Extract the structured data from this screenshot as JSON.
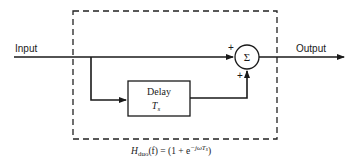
{
  "diagram": {
    "input_label": "Input",
    "output_label": "Output",
    "sum_symbol": "Σ",
    "sum_inputs": [
      "+",
      "+"
    ],
    "delay_block": {
      "title": "Delay",
      "param_main": "T",
      "param_sub": "s"
    },
    "transfer_function": {
      "lhs_main": "H",
      "lhs_sub": "duo",
      "lhs_arg": "(f) = (1 + e",
      "exponent": "−jωT",
      "exponent_sub": "s",
      "close": ")"
    }
  }
}
